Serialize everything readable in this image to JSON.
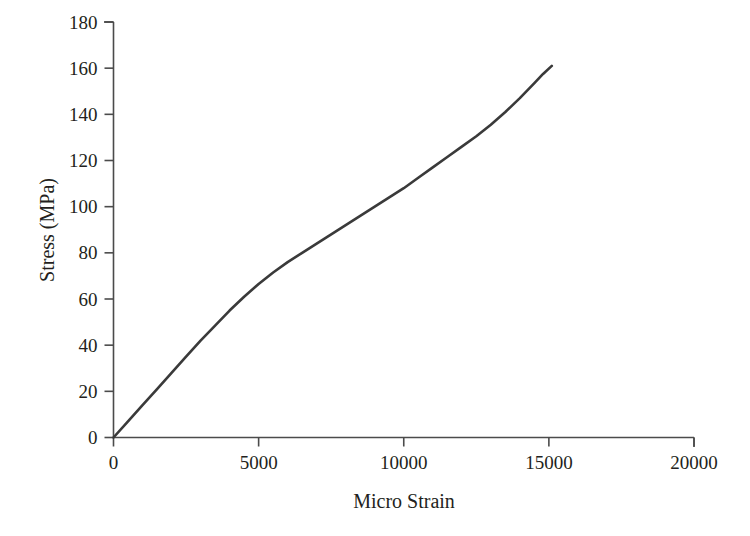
{
  "chart_data": {
    "type": "line",
    "title": "",
    "subtitle": "",
    "xlabel": "Micro Strain",
    "ylabel": "Stress (MPa)",
    "xlim": [
      0,
      20000
    ],
    "ylim": [
      0,
      180
    ],
    "xticks": [
      0,
      5000,
      10000,
      15000,
      20000
    ],
    "yticks": [
      0,
      20,
      40,
      60,
      80,
      100,
      120,
      140,
      160,
      180
    ],
    "xtick_labels": [
      "0",
      "5000",
      "10000",
      "15000",
      "20000"
    ],
    "ytick_labels": [
      "0",
      "20",
      "40",
      "60",
      "80",
      "100",
      "120",
      "140",
      "160",
      "180"
    ],
    "grid": false,
    "legend": false,
    "legend_position": "none",
    "annotations": [],
    "series": [
      {
        "name": "Stress-Strain Curve",
        "color": "#3a3a3a",
        "line_width": 2.6,
        "x": [
          0,
          500,
          1000,
          1500,
          2000,
          2500,
          3000,
          3500,
          4000,
          4500,
          5000,
          5500,
          6000,
          6500,
          7000,
          7500,
          8000,
          8500,
          9000,
          9500,
          10000,
          10500,
          11000,
          11500,
          12000,
          12500,
          13000,
          13500,
          14000,
          14500,
          14800,
          15100
        ],
        "y": [
          0,
          7,
          14,
          21,
          28,
          35,
          42,
          48.5,
          55,
          61,
          66.5,
          71.5,
          76,
          80,
          84,
          88,
          92,
          96,
          100,
          104,
          108,
          112.5,
          117,
          121.5,
          126,
          130.5,
          135.5,
          141,
          147,
          153.5,
          157.5,
          161
        ]
      }
    ]
  },
  "axes": {
    "ylabel_text": "Stress (MPa)",
    "xlabel_text": "Micro Strain"
  }
}
